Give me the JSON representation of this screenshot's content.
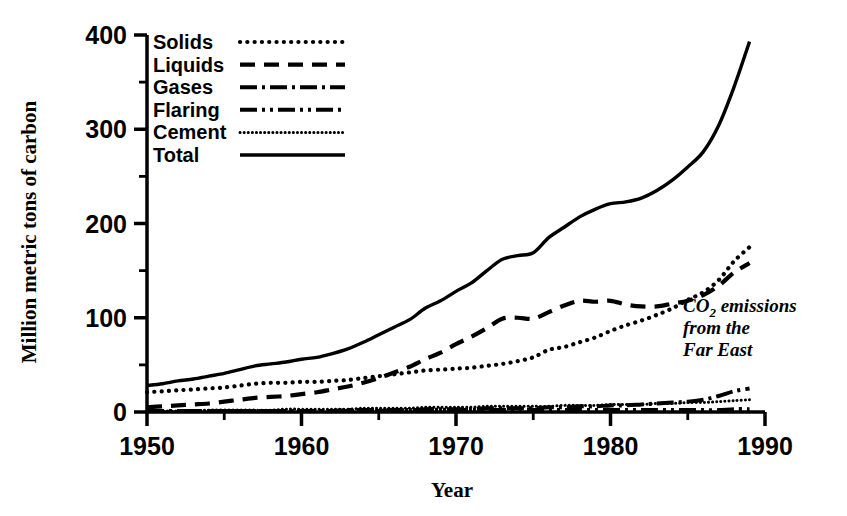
{
  "chart_data": {
    "type": "line",
    "title": "",
    "annotation": {
      "line1_pre": "CO",
      "line1_sub": "2",
      "line1_post": " emissions",
      "line2": "from the",
      "line3": "Far East"
    },
    "xlabel": "Year",
    "ylabel": "Million metric tons of carbon",
    "xlim": [
      1950,
      1990
    ],
    "ylim": [
      0,
      400
    ],
    "xticks": [
      1950,
      1960,
      1970,
      1980,
      1990
    ],
    "xticklabels": [
      "1950",
      "1960",
      "1970",
      "1980",
      "1990"
    ],
    "xminor_step": 5,
    "yticks": [
      0,
      100,
      200,
      300,
      400
    ],
    "yticklabels": [
      "0",
      "100",
      "200",
      "300",
      "400"
    ],
    "yminor_step": 50,
    "grid": false,
    "legend_position": "upper-left-inside",
    "x": [
      1950,
      1951,
      1952,
      1953,
      1954,
      1955,
      1956,
      1957,
      1958,
      1959,
      1960,
      1961,
      1962,
      1963,
      1964,
      1965,
      1966,
      1967,
      1968,
      1969,
      1970,
      1971,
      1972,
      1973,
      1974,
      1975,
      1976,
      1977,
      1978,
      1979,
      1980,
      1981,
      1982,
      1983,
      1984,
      1985,
      1986,
      1987,
      1988,
      1989
    ],
    "series": [
      {
        "name": "Solids",
        "style": "dotted",
        "values": [
          21,
          22,
          23,
          24,
          25,
          26,
          28,
          30,
          31,
          31,
          32,
          32,
          33,
          34,
          36,
          38,
          40,
          42,
          44,
          45,
          46,
          47,
          49,
          51,
          54,
          58,
          66,
          69,
          74,
          79,
          86,
          92,
          97,
          103,
          110,
          119,
          127,
          140,
          160,
          175
        ]
      },
      {
        "name": "Liquids",
        "style": "dashed",
        "values": [
          5,
          6,
          7,
          8,
          9,
          11,
          13,
          15,
          16,
          17,
          19,
          21,
          24,
          27,
          31,
          36,
          42,
          48,
          56,
          63,
          72,
          80,
          89,
          99,
          100,
          99,
          106,
          113,
          118,
          117,
          118,
          114,
          112,
          112,
          115,
          118,
          124,
          134,
          148,
          158
        ]
      },
      {
        "name": "Gases",
        "style": "dashdot",
        "values": [
          1,
          1,
          1,
          1,
          1,
          1,
          1,
          1,
          1,
          1,
          1,
          1,
          1,
          2,
          2,
          2,
          2,
          2,
          3,
          3,
          3,
          3,
          4,
          4,
          4,
          4,
          5,
          5,
          6,
          6,
          7,
          7,
          8,
          9,
          10,
          11,
          13,
          17,
          22,
          25
        ]
      },
      {
        "name": "Flaring",
        "style": "dashdotdot",
        "values": [
          1,
          1,
          1,
          1,
          1,
          1,
          1,
          1,
          1,
          1,
          1,
          1,
          1,
          1,
          1,
          1,
          2,
          2,
          2,
          2,
          2,
          2,
          2,
          2,
          2,
          2,
          2,
          2,
          2,
          2,
          2,
          2,
          2,
          2,
          2,
          2,
          2,
          2,
          3,
          3
        ]
      },
      {
        "name": "Cement",
        "style": "finedot",
        "values": [
          1,
          1,
          1,
          1,
          2,
          2,
          2,
          2,
          2,
          3,
          3,
          3,
          3,
          3,
          4,
          4,
          4,
          4,
          5,
          5,
          5,
          5,
          6,
          6,
          6,
          6,
          6,
          7,
          7,
          7,
          8,
          8,
          8,
          9,
          9,
          10,
          10,
          11,
          12,
          13
        ]
      },
      {
        "name": "Total",
        "style": "solid",
        "values": [
          28,
          30,
          33,
          35,
          38,
          41,
          45,
          49,
          51,
          53,
          56,
          58,
          62,
          67,
          74,
          82,
          90,
          98,
          110,
          118,
          128,
          137,
          150,
          162,
          166,
          169,
          185,
          196,
          207,
          215,
          221,
          223,
          227,
          235,
          246,
          260,
          276,
          304,
          345,
          393
        ]
      }
    ]
  },
  "legend": {
    "entries": [
      {
        "label": "Solids",
        "style": "dotted"
      },
      {
        "label": "Liquids",
        "style": "dashed"
      },
      {
        "label": "Gases",
        "style": "dashdot"
      },
      {
        "label": "Flaring",
        "style": "dashdotdot"
      },
      {
        "label": "Cement",
        "style": "finedot"
      },
      {
        "label": "Total",
        "style": "solid"
      }
    ]
  },
  "colors": {
    "ink": "#000000",
    "background": "#ffffff"
  }
}
